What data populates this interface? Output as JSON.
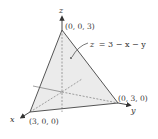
{
  "figure": {
    "axes": {
      "x": "x",
      "y": "y",
      "z": "z"
    },
    "vertices": {
      "z_intercept": "(0, 0, 3)",
      "y_intercept": "(0, 3, 0)",
      "x_intercept": "(3, 0, 0)"
    },
    "equation": {
      "lhs": "z",
      "rhs": "= 3 − x − y"
    },
    "colors": {
      "plane_fill": "#ebebeb",
      "edge": "#555555",
      "axis": "#555555",
      "text": "#333333"
    }
  }
}
